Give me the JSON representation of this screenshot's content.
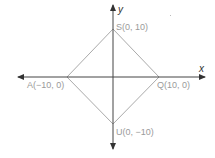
{
  "axes": {
    "x_label": "x",
    "y_label": "y",
    "color": "#444444"
  },
  "shape": {
    "type": "square (rotated diamond)",
    "color": "#aaaaaa",
    "vertices": [
      {
        "name": "S",
        "label": "S(0, 10)",
        "x": 0,
        "y": 10
      },
      {
        "name": "Q",
        "label": "Q(10, 0)",
        "x": 10,
        "y": 0
      },
      {
        "name": "U",
        "label": "U(0, −10)",
        "x": 0,
        "y": -10
      },
      {
        "name": "A",
        "label": "A(−10, 0)",
        "x": -10,
        "y": 0
      }
    ]
  },
  "label_color": "#9a9a9a"
}
